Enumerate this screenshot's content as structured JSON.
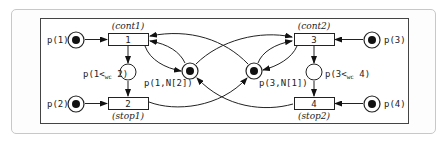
{
  "diagram": {
    "type": "petri-net",
    "places": [
      {
        "id": "p1",
        "label": "p(1)",
        "tokens": 1
      },
      {
        "id": "p2",
        "label": "p(2)",
        "tokens": 1
      },
      {
        "id": "p3",
        "label": "p(3)",
        "tokens": 1
      },
      {
        "id": "p4",
        "label": "p(4)",
        "tokens": 1
      },
      {
        "id": "p1wc2",
        "label_prefix": "p(1<",
        "label_sub": "wc",
        "label_suffix": " 2)",
        "tokens": 0
      },
      {
        "id": "p3wc4",
        "label_prefix": "p(3<",
        "label_sub": "wc",
        "label_suffix": " 4)",
        "tokens": 0
      },
      {
        "id": "p1N2",
        "label": "p(1,N[2])",
        "tokens": 1
      },
      {
        "id": "p3N1",
        "label": "p(3,N[1])",
        "tokens": 1
      }
    ],
    "transitions": [
      {
        "id": "t1",
        "number": "1",
        "name": "(cont1)"
      },
      {
        "id": "t2",
        "number": "2",
        "name": "(stop1)"
      },
      {
        "id": "t3",
        "number": "3",
        "name": "(cont2)"
      },
      {
        "id": "t4",
        "number": "4",
        "name": "(stop2)"
      }
    ],
    "arcs": [
      [
        "p1",
        "t1"
      ],
      [
        "p2",
        "t2"
      ],
      [
        "p3",
        "t3"
      ],
      [
        "p4",
        "t4"
      ],
      [
        "t1",
        "p1wc2"
      ],
      [
        "p1wc2",
        "t2"
      ],
      [
        "t3",
        "p3wc4"
      ],
      [
        "p3wc4",
        "t4"
      ],
      [
        "t1",
        "p1N2"
      ],
      [
        "p1N2",
        "t1"
      ],
      [
        "p1N2",
        "t3"
      ],
      [
        "t2",
        "p3N1"
      ],
      [
        "t3",
        "p3N1"
      ],
      [
        "p3N1",
        "t3"
      ],
      [
        "p3N1",
        "t1"
      ],
      [
        "t4",
        "p1N2"
      ]
    ]
  }
}
